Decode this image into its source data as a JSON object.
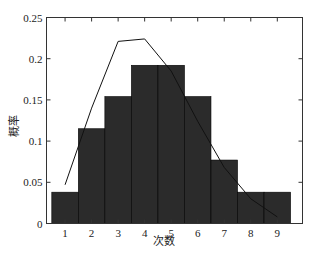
{
  "chart_data": {
    "type": "bar",
    "title": "",
    "xlabel": "次数",
    "ylabel": "概率",
    "categories": [
      "1",
      "2",
      "3",
      "4",
      "5",
      "6",
      "7",
      "8",
      "9"
    ],
    "x": [
      1,
      2,
      3,
      4,
      5,
      6,
      7,
      8,
      9
    ],
    "series": [
      {
        "name": "histogram",
        "type": "bar",
        "color": "#2b2b2b",
        "values": [
          0.038,
          0.115,
          0.154,
          0.192,
          0.192,
          0.154,
          0.077,
          0.038,
          0.038
        ]
      },
      {
        "name": "fit-curve",
        "type": "line",
        "color": "#111111",
        "x": [
          1,
          2,
          3,
          4,
          5,
          6,
          7,
          8,
          9
        ],
        "values": [
          0.047,
          0.14,
          0.221,
          0.224,
          0.185,
          0.124,
          0.068,
          0.03,
          0.008
        ]
      }
    ],
    "xlim": [
      0.3,
      9.95
    ],
    "ylim": [
      0,
      0.25
    ],
    "yticks": [
      0,
      0.05,
      0.1,
      0.15,
      0.2,
      0.25
    ],
    "ytick_labels": [
      "0",
      "0.05",
      "0.1",
      "0.15",
      "0.2",
      "0.25"
    ],
    "xtick_labels": [
      "1",
      "2",
      "3",
      "4",
      "5",
      "6",
      "7",
      "8",
      "9"
    ],
    "grid": false,
    "legend": null
  }
}
